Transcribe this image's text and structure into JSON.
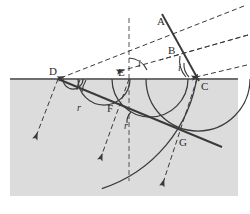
{
  "figure": {
    "type": "physics-ray-diagram",
    "width": 250,
    "height": 214,
    "colors": {
      "background": "#ffffff",
      "medium_fill": "#dcdcdc",
      "line": "#3a3a3a",
      "surface_line": "#6e6e6e",
      "label_text": "#2b2b2b"
    },
    "media": {
      "upper_label": "",
      "lower_label": "",
      "lower_fill": "#dcdcdc"
    },
    "points": [
      {
        "id": "A",
        "label": "A",
        "x": 167,
        "y": 24,
        "label_x": 157,
        "label_y": 16
      },
      {
        "id": "B",
        "label": "B",
        "x": 180,
        "y": 53,
        "label_x": 168,
        "label_y": 45
      },
      {
        "id": "C",
        "label": "C",
        "x": 197,
        "y": 79,
        "label_x": 201,
        "label_y": 81
      },
      {
        "id": "D",
        "label": "D",
        "x": 58,
        "y": 79,
        "label_x": 49,
        "label_y": 66
      },
      {
        "id": "E",
        "label": "E",
        "x": 129,
        "y": 79,
        "label_x": 118,
        "label_y": 67
      },
      {
        "id": "F",
        "label": "F",
        "x": 121,
        "y": 110,
        "label_x": 107,
        "label_y": 103
      },
      {
        "id": "G",
        "label": "G",
        "x": 179,
        "y": 135,
        "label_x": 179,
        "label_y": 137
      }
    ],
    "angle_labels": [
      {
        "id": "i-at-E",
        "label": "i",
        "x": 138,
        "y": 59
      },
      {
        "id": "i-at-C",
        "label": "i",
        "x": 178,
        "y": 63
      },
      {
        "id": "r-at-D",
        "label": "r",
        "x": 77,
        "y": 103
      },
      {
        "id": "r-at-F",
        "label": "r",
        "x": 124,
        "y": 121
      }
    ],
    "elements": {
      "surface_line": "horizontal boundary between the two media",
      "normal_line": "vertical dashed normal at E",
      "incident_wavefront": "line A-B-C (solid) representing incident wavefront",
      "refracted_wavefront": "line D-F-G (solid) representing refracted wavefront",
      "incident_rays": 3,
      "refracted_rays": 3,
      "huygens_wavelets": 4
    }
  }
}
